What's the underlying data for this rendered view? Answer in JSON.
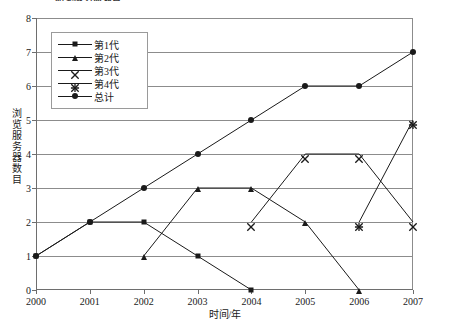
{
  "chart_data": {
    "type": "line",
    "title": "浏览服务器数目",
    "xlabel": "时间/年",
    "ylabel": "浏览服务器数目",
    "categories": [
      "2000",
      "2001",
      "2002",
      "2003",
      "2004",
      "2005",
      "2006",
      "2007"
    ],
    "x": [
      2000,
      2001,
      2002,
      2003,
      2004,
      2005,
      2006,
      2007
    ],
    "xlim": [
      2000,
      2007
    ],
    "ylim": [
      0,
      8
    ],
    "yticks": [
      0,
      1,
      2,
      3,
      4,
      5,
      6,
      7,
      8
    ],
    "grid": "horizontal",
    "legend_position": "upper-left",
    "series": [
      {
        "name": "第1代",
        "marker": "square",
        "x": [
          2000,
          2001,
          2002,
          2003,
          2004
        ],
        "values": [
          1,
          2,
          2,
          1,
          0
        ]
      },
      {
        "name": "第2代",
        "marker": "triangle",
        "x": [
          2002,
          2003,
          2004,
          2005,
          2006
        ],
        "values": [
          1,
          3,
          3,
          2,
          0
        ]
      },
      {
        "name": "第3代",
        "marker": "x",
        "x": [
          2004,
          2005,
          2006,
          2007
        ],
        "values": [
          2,
          4,
          4,
          2
        ]
      },
      {
        "name": "第4代",
        "marker": "star",
        "x": [
          2006,
          2007
        ],
        "values": [
          2,
          5
        ]
      },
      {
        "name": "总计",
        "marker": "circle",
        "x": [
          2000,
          2001,
          2002,
          2003,
          2004,
          2005,
          2006,
          2007
        ],
        "values": [
          1,
          2,
          3,
          4,
          5,
          6,
          6,
          7
        ]
      }
    ]
  },
  "legend": {
    "items": [
      {
        "label": "第1代",
        "marker": "square"
      },
      {
        "label": "第2代",
        "marker": "triangle"
      },
      {
        "label": "第3代",
        "marker": "x"
      },
      {
        "label": "第4代",
        "marker": "star"
      },
      {
        "label": "总计",
        "marker": "circle"
      }
    ]
  },
  "axes": {
    "x_title": "时间/年",
    "y_title": "浏览服务器数目"
  },
  "colors": {
    "line": "#1a1a1a",
    "grid": "#8c8c8c",
    "axis": "#6e6e6e",
    "legend_border": "#9a9a9a",
    "background": "#ffffff"
  }
}
